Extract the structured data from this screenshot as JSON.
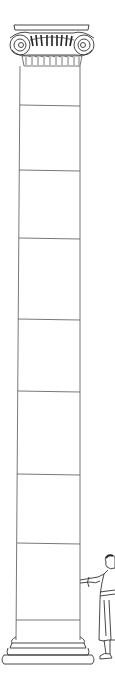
{
  "figure": {
    "subject": "Ionic column with human figure for scale",
    "parts": {
      "capital": "Ionic capital with volutes",
      "shaft": "Column shaft",
      "base": "Stepped base",
      "figure": "Standing human figure"
    },
    "shaft_drums": 8,
    "colors": {
      "line": "#555555",
      "background": "#ffffff"
    }
  }
}
